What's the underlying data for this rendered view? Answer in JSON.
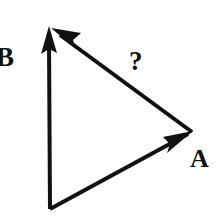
{
  "figure": {
    "kind": "vector-triangle-diagram",
    "background_color": "#fdfdfd",
    "stroke_color": "#111111",
    "canvas": {
      "width": 218,
      "height": 216
    }
  },
  "labels": {
    "vector_b": "B",
    "unknown": "?",
    "vector_a": "A"
  },
  "vectors": [
    {
      "name": "vector-b",
      "label": "B",
      "from": {
        "x": 50,
        "y": 209
      },
      "to": {
        "x": 49,
        "y": 27
      },
      "direction": "up",
      "has_arrowhead": true,
      "stroke_width": 4
    },
    {
      "name": "vector-a",
      "label": "A",
      "from": {
        "x": 50,
        "y": 209
      },
      "to": {
        "x": 192,
        "y": 132
      },
      "direction": "up-right",
      "has_arrowhead": true,
      "stroke_width": 4
    },
    {
      "name": "vector-unknown",
      "label": "?",
      "from": {
        "x": 192,
        "y": 132
      },
      "to": {
        "x": 53,
        "y": 29
      },
      "direction": "up-left",
      "has_arrowhead": true,
      "stroke_width": 4
    }
  ],
  "vertices": {
    "apex": {
      "x": 50,
      "y": 27
    },
    "bottom": {
      "x": 50,
      "y": 209
    },
    "right": {
      "x": 192,
      "y": 132
    }
  }
}
